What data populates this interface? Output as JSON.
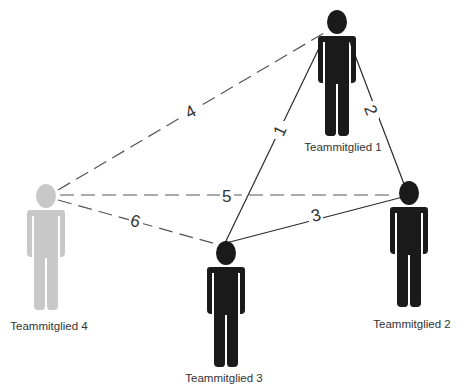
{
  "diagram": {
    "colors": {
      "active_member": "#1a1a1a",
      "inactive_member": "#c8c8c8",
      "solid_edge": "#2a2a2a",
      "dashed_edge": "#555555",
      "text": "#333333"
    },
    "members": [
      {
        "id": "tm1",
        "label": "Teammitglied 1",
        "active": true
      },
      {
        "id": "tm2",
        "label": "Teammitglied 2",
        "active": true
      },
      {
        "id": "tm3",
        "label": "Teammitglied 3",
        "active": true
      },
      {
        "id": "tm4",
        "label": "Teammitglied 4",
        "active": false
      }
    ],
    "edges": [
      {
        "label": "1",
        "from": "tm3",
        "to": "tm1",
        "style": "solid"
      },
      {
        "label": "2",
        "from": "tm1",
        "to": "tm2",
        "style": "solid"
      },
      {
        "label": "3",
        "from": "tm3",
        "to": "tm2",
        "style": "solid"
      },
      {
        "label": "4",
        "from": "tm4",
        "to": "tm1",
        "style": "dashed"
      },
      {
        "label": "5",
        "from": "tm4",
        "to": "tm2",
        "style": "dashed"
      },
      {
        "label": "6",
        "from": "tm4",
        "to": "tm3",
        "style": "dashed"
      }
    ]
  }
}
